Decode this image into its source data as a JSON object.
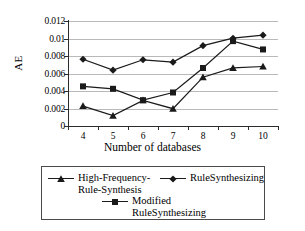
{
  "chart_data": {
    "type": "line",
    "title": "",
    "xlabel": "Number of databases",
    "ylabel": "AE",
    "categories": [
      4,
      5,
      6,
      7,
      8,
      9,
      10
    ],
    "ylim": [
      0,
      0.012
    ],
    "ytick_values": [
      0,
      0.002,
      0.004,
      0.006,
      0.008,
      0.01,
      0.012
    ],
    "ytick_labels": [
      "0",
      "0.002",
      "0.004",
      "0.006",
      "0.008",
      "0.01",
      "0.012"
    ],
    "xtick_labels": [
      "4",
      "5",
      "6",
      "7",
      "8",
      "9",
      "10"
    ],
    "grid": "horizontal",
    "legend_position": "below",
    "series": [
      {
        "name": "High-Frequency-Rule-Synthesis",
        "legend_label": "High-Frequency-\nRule-Synthesis",
        "marker": "triangle",
        "color": "#1a1a1a",
        "values": [
          0.00228,
          0.00118,
          0.00293,
          0.00198,
          0.00558,
          0.00663,
          0.0068
        ]
      },
      {
        "name": "RuleSynthesizing",
        "legend_label": "RuleSynthesizing",
        "marker": "diamond",
        "color": "#1a1a1a",
        "values": [
          0.00763,
          0.00638,
          0.00757,
          0.0073,
          0.00918,
          0.01003,
          0.01038
        ]
      },
      {
        "name": "Modified RuleSynthesizing",
        "legend_label": "Modified\nRuleSynthesizing",
        "marker": "square",
        "color": "#1a1a1a",
        "values": [
          0.00453,
          0.00425,
          0.00295,
          0.00383,
          0.00663,
          0.0097,
          0.00875
        ]
      }
    ]
  },
  "legend": {
    "entries": [
      {
        "label": "High-Frequency-\nRule-Synthesis",
        "marker": "triangle"
      },
      {
        "label": "RuleSynthesizing",
        "marker": "diamond"
      },
      {
        "label": "Modified\nRuleSynthesizing",
        "marker": "square"
      }
    ]
  },
  "colors": {
    "ink": "#1a1a1a",
    "axis": "#2b2b2b",
    "gridline": "#b9b9b9",
    "legend_border": "#4a4a4a",
    "background": "#ffffff"
  }
}
